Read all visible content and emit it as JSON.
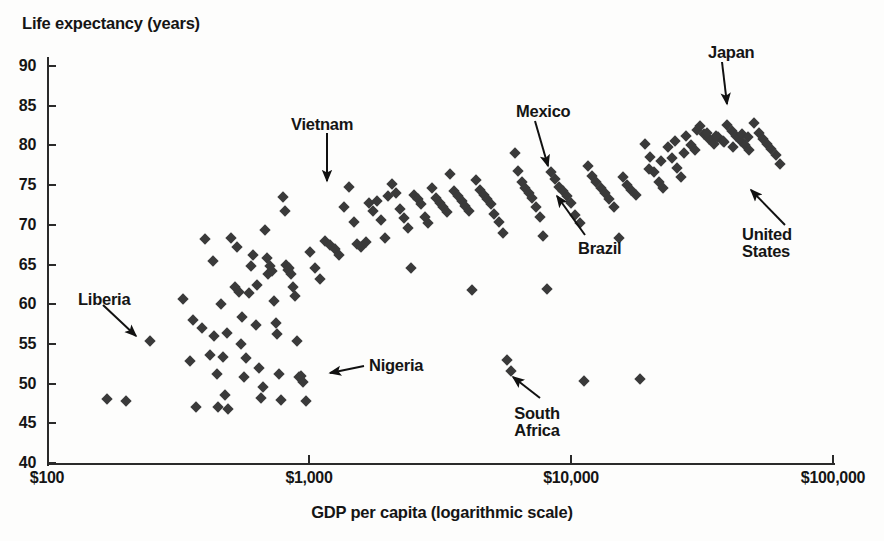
{
  "chart_data": {
    "type": "scatter",
    "title": "",
    "ylabel": "Life expectancy (years)",
    "xlabel": "GDP per capita (logarithmic scale)",
    "xscale": "log",
    "xlim": [
      100,
      100000
    ],
    "ylim": [
      40,
      90
    ],
    "grid": false,
    "legend": null,
    "ytick_labels": [
      "90",
      "85",
      "80",
      "75",
      "70",
      "65",
      "60",
      "55",
      "50",
      "45",
      "40"
    ],
    "yticks": [
      90,
      85,
      80,
      75,
      70,
      65,
      60,
      55,
      50,
      45,
      40
    ],
    "xtick_labels": [
      "$100",
      "$1,000",
      "$10,000",
      "$100,000"
    ],
    "xticks": [
      100,
      1000,
      10000,
      100000
    ],
    "marker": "diamond",
    "marker_color": "#3a3a3a",
    "annotations": [
      {
        "label": "Liberia",
        "lines": [
          "Liberia"
        ],
        "text_x": 78,
        "text_y": 291,
        "align": "left",
        "arrow_from": [
          103,
          305
        ],
        "arrow_to": [
          136,
          336
        ]
      },
      {
        "label": "Vietnam",
        "lines": [
          "Vietnam"
        ],
        "text_x": 291,
        "text_y": 116,
        "align": "left",
        "arrow_from": [
          327,
          133
        ],
        "arrow_to": [
          327,
          181
        ]
      },
      {
        "label": "Nigeria",
        "lines": [
          "Nigeria"
        ],
        "text_x": 369,
        "text_y": 357,
        "align": "left",
        "arrow_from": [
          364,
          366
        ],
        "arrow_to": [
          330,
          373
        ]
      },
      {
        "label": "South Africa",
        "lines": [
          "South",
          "Africa"
        ],
        "text_x": 537,
        "text_y": 405,
        "align": "center",
        "arrow_from": [
          540,
          398
        ],
        "arrow_to": [
          513,
          377
        ]
      },
      {
        "label": "Mexico",
        "lines": [
          "Mexico"
        ],
        "text_x": 516,
        "text_y": 103,
        "align": "left",
        "arrow_from": [
          535,
          121
        ],
        "arrow_to": [
          548,
          166
        ]
      },
      {
        "label": "Brazil",
        "lines": [
          "Brazil"
        ],
        "text_x": 578,
        "text_y": 240,
        "align": "left",
        "arrow_from": [
          585,
          235
        ],
        "arrow_to": [
          557,
          196
        ]
      },
      {
        "label": "Japan",
        "lines": [
          "Japan"
        ],
        "text_x": 708,
        "text_y": 44,
        "align": "left",
        "arrow_from": [
          722,
          62
        ],
        "arrow_to": [
          727,
          104
        ]
      },
      {
        "label": "United States",
        "lines": [
          "United",
          "States"
        ],
        "text_x": 742,
        "text_y": 226,
        "align": "left",
        "arrow_from": [
          785,
          225
        ],
        "arrow_to": [
          751,
          190
        ]
      }
    ],
    "points": [
      {
        "gdp": 170,
        "life": 48.0
      },
      {
        "gdp": 200,
        "life": 47.8
      },
      {
        "gdp": 248,
        "life": 55.4
      },
      {
        "gdp": 330,
        "life": 60.6
      },
      {
        "gdp": 352,
        "life": 52.8
      },
      {
        "gdp": 360,
        "life": 58.0
      },
      {
        "gdp": 370,
        "life": 47.0
      },
      {
        "gdp": 392,
        "life": 57.0
      },
      {
        "gdp": 400,
        "life": 68.2
      },
      {
        "gdp": 420,
        "life": 53.6
      },
      {
        "gdp": 430,
        "life": 65.4
      },
      {
        "gdp": 435,
        "life": 56.0
      },
      {
        "gdp": 444,
        "life": 51.2
      },
      {
        "gdp": 450,
        "life": 47.0
      },
      {
        "gdp": 460,
        "life": 60.0
      },
      {
        "gdp": 470,
        "life": 53.4
      },
      {
        "gdp": 478,
        "life": 48.6
      },
      {
        "gdp": 485,
        "life": 56.4
      },
      {
        "gdp": 492,
        "life": 46.8
      },
      {
        "gdp": 505,
        "life": 68.4
      },
      {
        "gdp": 520,
        "life": 62.2
      },
      {
        "gdp": 530,
        "life": 67.2
      },
      {
        "gdp": 540,
        "life": 61.5
      },
      {
        "gdp": 548,
        "life": 55.0
      },
      {
        "gdp": 556,
        "life": 58.4
      },
      {
        "gdp": 565,
        "life": 50.8
      },
      {
        "gdp": 575,
        "life": 53.2
      },
      {
        "gdp": 588,
        "life": 61.4
      },
      {
        "gdp": 600,
        "life": 64.8
      },
      {
        "gdp": 612,
        "life": 66.2
      },
      {
        "gdp": 625,
        "life": 57.4
      },
      {
        "gdp": 635,
        "life": 62.4
      },
      {
        "gdp": 645,
        "life": 52.0
      },
      {
        "gdp": 655,
        "life": 48.2
      },
      {
        "gdp": 668,
        "life": 49.6
      },
      {
        "gdp": 678,
        "life": 69.4
      },
      {
        "gdp": 690,
        "life": 65.8
      },
      {
        "gdp": 700,
        "life": 63.8
      },
      {
        "gdp": 712,
        "life": 64.8
      },
      {
        "gdp": 722,
        "life": 64.2
      },
      {
        "gdp": 735,
        "life": 60.4
      },
      {
        "gdp": 745,
        "life": 57.6
      },
      {
        "gdp": 755,
        "life": 56.2
      },
      {
        "gdp": 768,
        "life": 51.2
      },
      {
        "gdp": 780,
        "life": 47.9
      },
      {
        "gdp": 795,
        "life": 73.5
      },
      {
        "gdp": 808,
        "life": 71.8
      },
      {
        "gdp": 818,
        "life": 65.0
      },
      {
        "gdp": 830,
        "life": 64.3
      },
      {
        "gdp": 840,
        "life": 64.6
      },
      {
        "gdp": 855,
        "life": 63.8
      },
      {
        "gdp": 868,
        "life": 62.2
      },
      {
        "gdp": 885,
        "life": 61.0
      },
      {
        "gdp": 900,
        "life": 55.4
      },
      {
        "gdp": 915,
        "life": 50.8
      },
      {
        "gdp": 935,
        "life": 51.0
      },
      {
        "gdp": 952,
        "life": 50.2
      },
      {
        "gdp": 975,
        "life": 47.8
      },
      {
        "gdp": 1010,
        "life": 66.6
      },
      {
        "gdp": 1050,
        "life": 64.6
      },
      {
        "gdp": 1100,
        "life": 63.2
      },
      {
        "gdp": 1150,
        "life": 68.0
      },
      {
        "gdp": 1200,
        "life": 67.4
      },
      {
        "gdp": 1260,
        "life": 67.0
      },
      {
        "gdp": 1300,
        "life": 66.2
      },
      {
        "gdp": 1360,
        "life": 72.2
      },
      {
        "gdp": 1420,
        "life": 74.8
      },
      {
        "gdp": 1480,
        "life": 70.4
      },
      {
        "gdp": 1520,
        "life": 67.6
      },
      {
        "gdp": 1580,
        "life": 67.2
      },
      {
        "gdp": 1650,
        "life": 67.8
      },
      {
        "gdp": 1700,
        "life": 72.8
      },
      {
        "gdp": 1760,
        "life": 71.8
      },
      {
        "gdp": 1820,
        "life": 73.0
      },
      {
        "gdp": 1880,
        "life": 70.6
      },
      {
        "gdp": 1950,
        "life": 68.4
      },
      {
        "gdp": 2000,
        "life": 73.6
      },
      {
        "gdp": 2080,
        "life": 75.2
      },
      {
        "gdp": 2150,
        "life": 74.0
      },
      {
        "gdp": 2220,
        "life": 72.0
      },
      {
        "gdp": 2300,
        "life": 70.8
      },
      {
        "gdp": 2380,
        "life": 69.6
      },
      {
        "gdp": 2450,
        "life": 64.6
      },
      {
        "gdp": 2520,
        "life": 73.8
      },
      {
        "gdp": 2600,
        "life": 73.2
      },
      {
        "gdp": 2680,
        "life": 72.6
      },
      {
        "gdp": 2760,
        "life": 71.0
      },
      {
        "gdp": 2850,
        "life": 70.2
      },
      {
        "gdp": 2950,
        "life": 74.6
      },
      {
        "gdp": 3050,
        "life": 73.4
      },
      {
        "gdp": 3150,
        "life": 72.8
      },
      {
        "gdp": 3250,
        "life": 72.2
      },
      {
        "gdp": 3350,
        "life": 71.6
      },
      {
        "gdp": 3460,
        "life": 76.4
      },
      {
        "gdp": 3580,
        "life": 74.2
      },
      {
        "gdp": 3700,
        "life": 73.6
      },
      {
        "gdp": 3820,
        "life": 73.0
      },
      {
        "gdp": 3950,
        "life": 72.4
      },
      {
        "gdp": 4080,
        "life": 71.8
      },
      {
        "gdp": 4200,
        "life": 61.8
      },
      {
        "gdp": 4350,
        "life": 75.6
      },
      {
        "gdp": 4500,
        "life": 74.4
      },
      {
        "gdp": 4650,
        "life": 73.8
      },
      {
        "gdp": 4800,
        "life": 73.2
      },
      {
        "gdp": 4950,
        "life": 72.6
      },
      {
        "gdp": 5100,
        "life": 71.4
      },
      {
        "gdp": 5300,
        "life": 70.4
      },
      {
        "gdp": 5500,
        "life": 69.0
      },
      {
        "gdp": 5700,
        "life": 53.0
      },
      {
        "gdp": 5900,
        "life": 51.6
      },
      {
        "gdp": 6100,
        "life": 79.0
      },
      {
        "gdp": 6300,
        "life": 76.8
      },
      {
        "gdp": 6500,
        "life": 75.4
      },
      {
        "gdp": 6700,
        "life": 74.6
      },
      {
        "gdp": 6900,
        "life": 74.0
      },
      {
        "gdp": 7100,
        "life": 73.4
      },
      {
        "gdp": 7350,
        "life": 72.2
      },
      {
        "gdp": 7600,
        "life": 71.0
      },
      {
        "gdp": 7850,
        "life": 68.6
      },
      {
        "gdp": 8100,
        "life": 61.9
      },
      {
        "gdp": 8400,
        "life": 76.6
      },
      {
        "gdp": 8700,
        "life": 75.8
      },
      {
        "gdp": 9000,
        "life": 74.8
      },
      {
        "gdp": 9300,
        "life": 74.2
      },
      {
        "gdp": 9650,
        "life": 73.6
      },
      {
        "gdp": 10000,
        "life": 72.8
      },
      {
        "gdp": 10400,
        "life": 71.2
      },
      {
        "gdp": 10800,
        "life": 70.2
      },
      {
        "gdp": 11200,
        "life": 50.3
      },
      {
        "gdp": 11600,
        "life": 77.4
      },
      {
        "gdp": 12000,
        "life": 76.2
      },
      {
        "gdp": 12500,
        "life": 75.4
      },
      {
        "gdp": 13000,
        "life": 74.6
      },
      {
        "gdp": 13500,
        "life": 74.0
      },
      {
        "gdp": 14000,
        "life": 73.2
      },
      {
        "gdp": 14600,
        "life": 72.2
      },
      {
        "gdp": 15200,
        "life": 68.4
      },
      {
        "gdp": 15800,
        "life": 76.0
      },
      {
        "gdp": 16400,
        "life": 75.0
      },
      {
        "gdp": 17000,
        "life": 74.4
      },
      {
        "gdp": 17700,
        "life": 73.8
      },
      {
        "gdp": 18400,
        "life": 50.6
      },
      {
        "gdp": 19200,
        "life": 80.2
      },
      {
        "gdp": 20000,
        "life": 78.6
      },
      {
        "gdp": 20800,
        "life": 76.6
      },
      {
        "gdp": 21600,
        "life": 75.4
      },
      {
        "gdp": 22500,
        "life": 74.6
      },
      {
        "gdp": 23400,
        "life": 79.8
      },
      {
        "gdp": 24400,
        "life": 78.4
      },
      {
        "gdp": 25400,
        "life": 77.2
      },
      {
        "gdp": 26400,
        "life": 76.0
      },
      {
        "gdp": 27500,
        "life": 81.2
      },
      {
        "gdp": 28600,
        "life": 80.0
      },
      {
        "gdp": 29800,
        "life": 79.4
      },
      {
        "gdp": 31000,
        "life": 82.4
      },
      {
        "gdp": 32300,
        "life": 81.4
      },
      {
        "gdp": 33600,
        "life": 80.8
      },
      {
        "gdp": 35000,
        "life": 80.2
      },
      {
        "gdp": 36400,
        "life": 81.0
      },
      {
        "gdp": 37900,
        "life": 80.6
      },
      {
        "gdp": 39400,
        "life": 82.6
      },
      {
        "gdp": 41000,
        "life": 81.8
      },
      {
        "gdp": 42700,
        "life": 81.2
      },
      {
        "gdp": 44400,
        "life": 80.6
      },
      {
        "gdp": 46200,
        "life": 80.0
      },
      {
        "gdp": 48000,
        "life": 79.4
      },
      {
        "gdp": 50000,
        "life": 82.8
      },
      {
        "gdp": 52000,
        "life": 81.6
      },
      {
        "gdp": 54000,
        "life": 80.8
      },
      {
        "gdp": 56000,
        "life": 80.2
      },
      {
        "gdp": 58000,
        "life": 79.6
      },
      {
        "gdp": 60500,
        "life": 78.8
      },
      {
        "gdp": 63000,
        "life": 77.6
      },
      {
        "gdp": 30200,
        "life": 82.0
      },
      {
        "gdp": 33000,
        "life": 81.6
      },
      {
        "gdp": 35800,
        "life": 81.2
      },
      {
        "gdp": 38500,
        "life": 80.4
      },
      {
        "gdp": 41500,
        "life": 79.8
      },
      {
        "gdp": 44800,
        "life": 81.4
      },
      {
        "gdp": 47500,
        "life": 81.0
      },
      {
        "gdp": 25000,
        "life": 80.6
      },
      {
        "gdp": 27000,
        "life": 79.0
      },
      {
        "gdp": 22000,
        "life": 78.0
      },
      {
        "gdp": 19800,
        "life": 77.0
      }
    ]
  }
}
